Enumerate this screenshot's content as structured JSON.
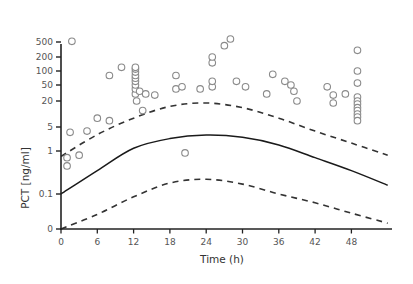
{
  "chart_data": {
    "type": "scatter",
    "title": "",
    "xlabel": "Time (h)",
    "ylabel": "PCT [ng/ml]",
    "xlim": [
      0,
      54
    ],
    "x_ticks": [
      0,
      6,
      12,
      18,
      24,
      30,
      36,
      42,
      48
    ],
    "y_ticks": [
      {
        "value": 0,
        "label": "0"
      },
      {
        "value": 0.1,
        "label": "0.1"
      },
      {
        "value": 1,
        "label": "1"
      },
      {
        "value": 5,
        "label": "5"
      },
      {
        "value": 20,
        "label": "20"
      },
      {
        "value": 50,
        "label": "50"
      },
      {
        "value": 100,
        "label": "100"
      },
      {
        "value": 200,
        "label": "200"
      },
      {
        "value": 500,
        "label": "500"
      }
    ],
    "y_scale": "log (with zero break)",
    "grid": false,
    "legend": "none",
    "series": [
      {
        "name": "Observed PCT",
        "kind": "scatter",
        "marker": "open-circle",
        "points": [
          [
            1.0,
            0.7
          ],
          [
            1.0,
            0.45
          ],
          [
            1.5,
            3.5
          ],
          [
            1.8,
            520
          ],
          [
            3.0,
            0.8
          ],
          [
            4.3,
            3.8
          ],
          [
            6.0,
            8
          ],
          [
            8.0,
            7
          ],
          [
            8.0,
            80
          ],
          [
            10.0,
            120
          ],
          [
            12.3,
            30
          ],
          [
            12.3,
            40
          ],
          [
            12.3,
            50
          ],
          [
            12.3,
            60
          ],
          [
            12.3,
            70
          ],
          [
            12.3,
            80
          ],
          [
            12.3,
            95
          ],
          [
            12.3,
            110
          ],
          [
            12.3,
            120
          ],
          [
            12.5,
            20
          ],
          [
            13.0,
            35
          ],
          [
            13.5,
            12
          ],
          [
            14.0,
            30
          ],
          [
            15.5,
            28
          ],
          [
            19.0,
            80
          ],
          [
            19.0,
            40
          ],
          [
            20.0,
            45
          ],
          [
            20.5,
            0.9
          ],
          [
            23.0,
            40
          ],
          [
            25.0,
            45
          ],
          [
            25.0,
            60
          ],
          [
            25.0,
            150
          ],
          [
            25.0,
            200
          ],
          [
            27.0,
            400
          ],
          [
            28.0,
            600
          ],
          [
            29.0,
            60
          ],
          [
            30.5,
            45
          ],
          [
            34.0,
            30
          ],
          [
            35.0,
            85
          ],
          [
            37.0,
            60
          ],
          [
            38.0,
            50
          ],
          [
            38.5,
            35
          ],
          [
            39.0,
            20
          ],
          [
            44.0,
            45
          ],
          [
            45.0,
            28
          ],
          [
            45.0,
            18
          ],
          [
            47.0,
            30
          ],
          [
            49.0,
            300
          ],
          [
            49.0,
            100
          ],
          [
            49.0,
            55
          ],
          [
            49.0,
            25
          ],
          [
            49.0,
            20
          ],
          [
            49.0,
            17
          ],
          [
            49.0,
            14
          ],
          [
            49.0,
            12
          ],
          [
            49.0,
            10
          ],
          [
            49.0,
            8.5
          ],
          [
            49.0,
            7
          ]
        ]
      },
      {
        "name": "Model median",
        "kind": "line",
        "style": "solid",
        "points": [
          [
            0,
            0.1
          ],
          [
            6,
            0.35
          ],
          [
            12,
            1.2
          ],
          [
            18,
            2.3
          ],
          [
            24,
            2.9
          ],
          [
            30,
            2.5
          ],
          [
            36,
            1.5
          ],
          [
            42,
            0.7
          ],
          [
            48,
            0.35
          ],
          [
            54,
            0.16
          ]
        ]
      },
      {
        "name": "Upper prediction bound",
        "kind": "line",
        "style": "dashed",
        "points": [
          [
            0,
            0.75
          ],
          [
            6,
            3.0
          ],
          [
            12,
            8
          ],
          [
            18,
            15
          ],
          [
            24,
            18
          ],
          [
            30,
            14
          ],
          [
            36,
            8
          ],
          [
            42,
            3.8
          ],
          [
            48,
            1.7
          ],
          [
            54,
            0.8
          ]
        ]
      },
      {
        "name": "Lower prediction bound",
        "kind": "line",
        "style": "dashed",
        "points": [
          [
            0,
            0
          ],
          [
            6,
            0.02
          ],
          [
            12,
            0.08
          ],
          [
            18,
            0.18
          ],
          [
            24,
            0.22
          ],
          [
            30,
            0.17
          ],
          [
            36,
            0.1
          ],
          [
            42,
            0.05
          ],
          [
            48,
            0.022
          ],
          [
            54,
            0.01
          ]
        ]
      }
    ]
  },
  "colors": {
    "axis": "#222222",
    "marker_stroke": "#8a8a8a",
    "line": "#1a1a1a",
    "dashed": "#333333"
  }
}
